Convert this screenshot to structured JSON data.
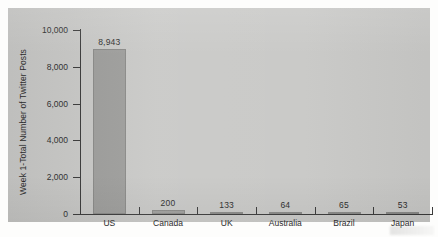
{
  "chart_data": {
    "type": "bar",
    "title": "",
    "xlabel": "",
    "ylabel": "Week 1-Total Number of Twitter Posts",
    "categories": [
      "US",
      "Canada",
      "UK",
      "Australia",
      "Brazil",
      "Japan"
    ],
    "values": [
      8943,
      200,
      133,
      64,
      65,
      53
    ],
    "value_labels": [
      "8,943",
      "200",
      "133",
      "64",
      "65",
      "53"
    ],
    "ylim": [
      0,
      10000
    ],
    "ytick_values": [
      10000,
      8000,
      6000,
      4000,
      2000,
      0
    ],
    "ytick_labels": [
      "10,000",
      "8,000",
      "6,000",
      "4,000",
      "2,000",
      "0"
    ],
    "grid": false,
    "legend": "none",
    "bar_color": "#9e9e9c",
    "axis_color": "#3b3b3b",
    "panel_color": "#c9c9c7",
    "page_color": "#fdfdfc"
  }
}
